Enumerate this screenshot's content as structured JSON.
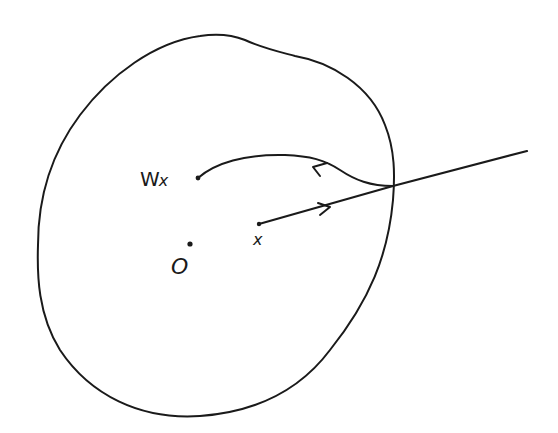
{
  "diagram": {
    "type": "hand-drawn geometric sketch",
    "labels": {
      "wx_main": "W",
      "wx_sub": "x",
      "x": "x",
      "origin": "O"
    },
    "elements": [
      {
        "name": "region-boundary",
        "kind": "closed-curve"
      },
      {
        "name": "ray-from-x",
        "kind": "ray",
        "from": "x",
        "direction": "outward",
        "arrow": "forward"
      },
      {
        "name": "return-curve",
        "kind": "curve",
        "from": "boundary-intersection",
        "to": "Wx",
        "arrow": "backward"
      },
      {
        "name": "point-x",
        "kind": "point",
        "label": "x"
      },
      {
        "name": "point-wx",
        "kind": "point",
        "label": "Wx"
      },
      {
        "name": "point-origin",
        "kind": "point",
        "label": "O"
      }
    ],
    "colors": {
      "ink": "#1a1a1a",
      "background": "#ffffff"
    }
  }
}
